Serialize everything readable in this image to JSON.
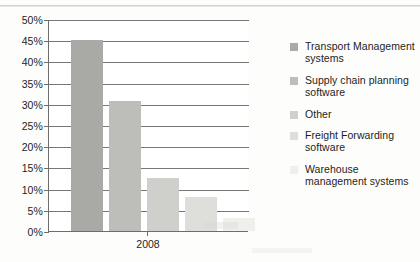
{
  "chart_data": {
    "type": "bar",
    "title": "",
    "xlabel": "",
    "ylabel": "",
    "categories": [
      "2008"
    ],
    "ylim": [
      0,
      50
    ],
    "ytick_labels": [
      "0%",
      "5%",
      "10%",
      "15%",
      "20%",
      "25%",
      "30%",
      "35%",
      "40%",
      "45%",
      "50%"
    ],
    "ytick_values": [
      0,
      5,
      10,
      15,
      20,
      25,
      30,
      35,
      40,
      45,
      50
    ],
    "grid": true,
    "legend_position": "right",
    "series": [
      {
        "name": "Transport Management systems",
        "values": [
          45
        ],
        "color": "#a9a9a6"
      },
      {
        "name": "Supply chain planning software",
        "values": [
          30.7
        ],
        "color": "#bdbdba"
      },
      {
        "name": "Other",
        "values": [
          12.5
        ],
        "color": "#cfcfcc"
      },
      {
        "name": "Freight Forwarding software",
        "values": [
          8
        ],
        "color": "#dededb"
      },
      {
        "name": "Warehouse management systems",
        "values": [
          3
        ],
        "color": "#efefec"
      }
    ]
  },
  "axis": {
    "x_category_label": "2008"
  }
}
